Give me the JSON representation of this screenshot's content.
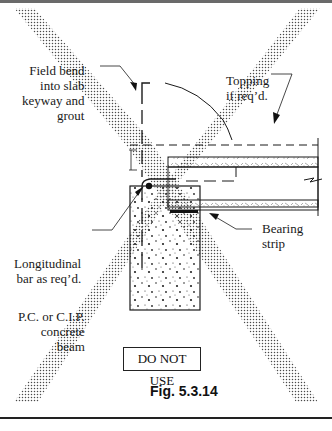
{
  "figure": {
    "caption": "Fig. 5.3.14",
    "warning_label": "DO NOT USE",
    "labels": {
      "field_bend": "Field bend\ninto slab\nkeyway and\ngrout",
      "topping": "Topping\nif req’d.",
      "bearing_strip": "Bearing\nstrip",
      "longitudinal_bar": "Longitudinal\nbar as req’d.",
      "beam": "P.C. or C.I.P.\nconcrete\nbeam"
    },
    "overlay": "large dotted X (crossed out)",
    "colors": {
      "line": "#1a1a1a",
      "dots": "#4a4a4a",
      "background": "#ffffff"
    }
  },
  "page": {
    "cut_off_text": "(cut-off text line below figure)"
  }
}
